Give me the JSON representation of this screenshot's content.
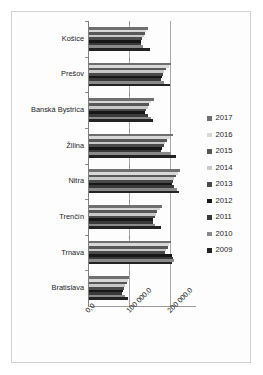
{
  "chart_data": {
    "type": "bar",
    "orientation": "horizontal",
    "title": "",
    "subtitle": "",
    "xlabel": "",
    "ylabel": "",
    "xlim": [
      0,
      200000
    ],
    "xticks": [
      0,
      100000,
      200000
    ],
    "xticklabels": [
      "0,0",
      "100 000,0",
      "200 000,0"
    ],
    "grid": true,
    "legend_position": "right",
    "categories": [
      "Košice",
      "Prešov",
      "Banská Bystrica",
      "Žilina",
      "Nitra",
      "Trenčín",
      "Trnava",
      "Bratislava"
    ],
    "series": [
      {
        "name": "2017",
        "color": "#6f6f6f",
        "values": [
          145000,
          200000,
          158000,
          205000,
          222000,
          178000,
          200000,
          98000
        ]
      },
      {
        "name": "2016",
        "color": "#d8d8d8",
        "values": [
          140000,
          194000,
          152000,
          197000,
          218000,
          172000,
          196000,
          95000
        ]
      },
      {
        "name": "2015",
        "color": "#585858",
        "values": [
          136000,
          188000,
          147000,
          191000,
          213000,
          167000,
          192000,
          92000
        ]
      },
      {
        "name": "2014",
        "color": "#c9c9c9",
        "values": [
          133000,
          183000,
          143000,
          186000,
          208000,
          163000,
          188000,
          89000
        ]
      },
      {
        "name": "2013",
        "color": "#4a4a4a",
        "values": [
          130000,
          180000,
          140000,
          182000,
          205000,
          160000,
          186000,
          86000
        ]
      },
      {
        "name": "2012",
        "color": "#171717",
        "values": [
          128000,
          178000,
          137000,
          179000,
          203000,
          157000,
          203000,
          83000
        ]
      },
      {
        "name": "2011",
        "color": "#3a3a3a",
        "values": [
          126000,
          176000,
          145000,
          176000,
          208000,
          155000,
          206000,
          80000
        ]
      },
      {
        "name": "2010",
        "color": "#8a8a8a",
        "values": [
          132000,
          182000,
          150000,
          200000,
          214000,
          160000,
          208000,
          88000
        ]
      },
      {
        "name": "2009",
        "color": "#232323",
        "values": [
          148000,
          198000,
          155000,
          212000,
          220000,
          175000,
          202000,
          96000
        ]
      }
    ]
  },
  "legend": {
    "items": [
      {
        "label": "2017"
      },
      {
        "label": "2016"
      },
      {
        "label": "2015"
      },
      {
        "label": "2014"
      },
      {
        "label": "2013"
      },
      {
        "label": "2012"
      },
      {
        "label": "2011"
      },
      {
        "label": "2010"
      },
      {
        "label": "2009"
      }
    ]
  },
  "style": {
    "plot_background": "#ffffff",
    "frame_border": "#d2d2d2",
    "axis_color": "#7f7f7f",
    "gridline_color": "#a8a8a8",
    "text_color": "#1c1c1c"
  }
}
